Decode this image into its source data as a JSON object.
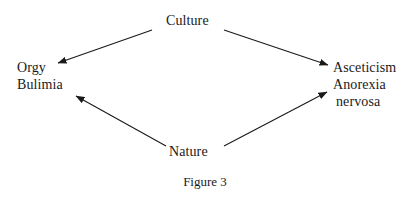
{
  "figure": {
    "caption": "Figure 3",
    "background_color": "#ffffff",
    "ink_color": "#1a1a1a"
  },
  "nodes": {
    "top": {
      "id": "culture",
      "label": "Culture"
    },
    "bottom": {
      "id": "nature",
      "label": "Nature"
    },
    "left": {
      "id": "orgy-bulimia",
      "line1": "Orgy",
      "line2": "Bulimia"
    },
    "right": {
      "id": "asceticism-anorexia",
      "line1": "Asceticism",
      "line2": "Anorexia",
      "line3": "nervosa"
    }
  },
  "arrows": [
    {
      "id": "culture-to-orgy",
      "from": "Culture",
      "to": "Orgy",
      "x1": 152,
      "y1": 30,
      "x2": 58,
      "y2": 63
    },
    {
      "id": "culture-to-asceticism",
      "from": "Culture",
      "to": "Asceticism",
      "x1": 224,
      "y1": 30,
      "x2": 328,
      "y2": 65
    },
    {
      "id": "nature-to-bulimia",
      "from": "Nature",
      "to": "Bulimia",
      "x1": 166,
      "y1": 146,
      "x2": 76,
      "y2": 96
    },
    {
      "id": "nature-to-anorexia",
      "from": "Nature",
      "to": "Anorexia nervosa",
      "x1": 224,
      "y1": 146,
      "x2": 327,
      "y2": 92
    }
  ]
}
